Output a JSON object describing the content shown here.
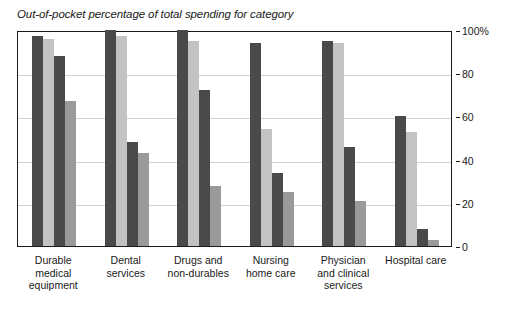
{
  "chart_data": {
    "type": "bar",
    "title": "Out-of-pocket percentage of total spending for category",
    "xlabel": "",
    "ylabel": "",
    "ylim": [
      0,
      100
    ],
    "grid": true,
    "legend": "none",
    "y_ticks": [
      "0",
      "20",
      "40",
      "60",
      "80",
      "100%"
    ],
    "y_tick_values": [
      0,
      20,
      40,
      60,
      80,
      100
    ],
    "categories": [
      "Durable medical equipment",
      "Dental services",
      "Drugs and non-durables",
      "Nursing home care",
      "Physician and clinical services",
      "Hospital care"
    ],
    "category_lines": [
      [
        "Durable",
        "medical",
        "equipment"
      ],
      [
        "Dental",
        "services"
      ],
      [
        "Drugs and",
        "non-durables"
      ],
      [
        "Nursing",
        "home care"
      ],
      [
        "Physician",
        "and clinical",
        "services"
      ],
      [
        "Hospital care"
      ]
    ],
    "series": [
      {
        "name": "Series 1",
        "color": "#4a4a4a",
        "shade": "dark",
        "values": [
          97,
          100,
          100,
          94,
          95,
          60
        ]
      },
      {
        "name": "Series 2",
        "color": "#c3c3c3",
        "shade": "light",
        "values": [
          96,
          97,
          95,
          54,
          94,
          53
        ]
      },
      {
        "name": "Series 3",
        "color": "#4a4a4a",
        "shade": "dark",
        "values": [
          88,
          48,
          72,
          34,
          46,
          8
        ]
      },
      {
        "name": "Series 4",
        "color": "#9a9a9a",
        "shade": "mid",
        "values": [
          67,
          43,
          28,
          25,
          21,
          3
        ]
      }
    ],
    "colors": {
      "dark": "#4a4a4a",
      "light": "#c3c3c3",
      "mid": "#9a9a9a",
      "axis": "#1a1a1a",
      "grid": "#d2d2d2",
      "background": "#ffffff"
    }
  }
}
